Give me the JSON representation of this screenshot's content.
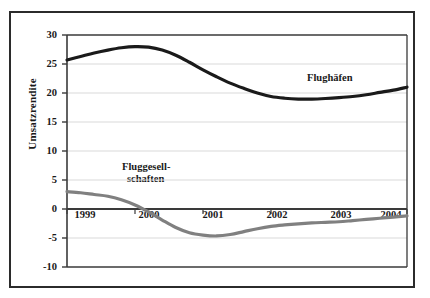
{
  "chart_data": {
    "type": "line",
    "title": "",
    "xlabel": "",
    "ylabel": "Umsatzrendite",
    "ylim": [
      -10,
      30
    ],
    "xlim": [
      1999,
      2004
    ],
    "yticks": [
      "30",
      "25",
      "20",
      "15",
      "10",
      "5",
      "0",
      "-5",
      "-10"
    ],
    "ytick_values": [
      30,
      25,
      20,
      15,
      10,
      5,
      0,
      -5,
      -10
    ],
    "xticks": [
      "1999",
      "2000",
      "2001",
      "2002",
      "2003",
      "2004"
    ],
    "xtick_values": [
      1999,
      2000,
      2001,
      2002,
      2003,
      2004
    ],
    "grid": true,
    "grid_axis": "y",
    "legend_position": "inline-annotations",
    "categories": [
      1999,
      2000,
      2001,
      2002,
      2003,
      2004
    ],
    "series": [
      {
        "name": "Flughäfen",
        "color": "#1a1a1a",
        "values": [
          25.7,
          28.0,
          24.0,
          19.3,
          19.2,
          21.0
        ],
        "dense_x": [
          1999.0,
          1999.2,
          1999.4,
          1999.6,
          1999.8,
          2000.0,
          2000.2,
          2000.4,
          2000.6,
          2000.8,
          2001.0,
          2001.2,
          2001.4,
          2001.6,
          2001.8,
          2002.0,
          2002.2,
          2002.4,
          2002.6,
          2002.8,
          2003.0,
          2003.2,
          2003.4,
          2003.6,
          2003.8,
          2004.0
        ],
        "dense_y": [
          25.7,
          26.3,
          26.9,
          27.4,
          27.8,
          28.0,
          27.9,
          27.4,
          26.5,
          25.3,
          24.0,
          22.8,
          21.7,
          20.8,
          20.0,
          19.4,
          19.1,
          18.95,
          18.95,
          19.05,
          19.2,
          19.4,
          19.7,
          20.1,
          20.5,
          21.0
        ]
      },
      {
        "name": "Fluggesellschaften",
        "color": "#808080",
        "values": [
          3.0,
          0.7,
          -4.4,
          -3.0,
          -2.2,
          -1.2
        ],
        "dense_x": [
          1999.0,
          1999.2,
          1999.4,
          1999.6,
          1999.8,
          2000.0,
          2000.2,
          2000.4,
          2000.6,
          2000.8,
          2001.0,
          2001.2,
          2001.4,
          2001.6,
          2001.8,
          2002.0,
          2002.2,
          2002.4,
          2002.6,
          2002.8,
          2003.0,
          2003.2,
          2003.4,
          2003.6,
          2003.8,
          2004.0
        ],
        "dense_y": [
          3.0,
          2.8,
          2.5,
          2.2,
          1.6,
          0.7,
          -0.5,
          -1.9,
          -3.2,
          -4.1,
          -4.5,
          -4.65,
          -4.4,
          -3.9,
          -3.4,
          -3.0,
          -2.75,
          -2.55,
          -2.4,
          -2.3,
          -2.2,
          -2.0,
          -1.8,
          -1.6,
          -1.4,
          -1.2
        ]
      }
    ],
    "annotations": [
      {
        "id": "label-flughaefen",
        "text": "Flughäfen",
        "x": 2003.0,
        "y": 23.0
      },
      {
        "id": "label-fluggesellschaften-line1",
        "text": "Fluggesell-",
        "x": 2000.0,
        "y": 7.0
      },
      {
        "id": "label-fluggesellschaften-line2",
        "text": "schaften",
        "x": 2000.0,
        "y": 5.0
      }
    ],
    "colors": {
      "series_airports": "#1a1a1a",
      "series_airlines": "#808080",
      "gridline": "#d9d9d9",
      "zero_line": "#3a3a3a",
      "axis": "#3a3a3a",
      "frame": "#2b2b2b",
      "background": "#ffffff",
      "text": "#1a1a1a"
    }
  },
  "axis": {
    "y_title": "Umsatzrendite"
  },
  "labels": {
    "flughaefen": "Flughäfen",
    "fluggesell_line1": "Fluggesell-",
    "fluggesell_line2": "schaften"
  },
  "ytick_labels": {
    "t0": "30",
    "t1": "25",
    "t2": "20",
    "t3": "15",
    "t4": "10",
    "t5": "5",
    "t6": "0",
    "t7": "-5",
    "t8": "-10"
  },
  "xtick_labels": {
    "t0": "1999",
    "t1": "2000",
    "t2": "2001",
    "t3": "2002",
    "t4": "2003",
    "t5": "2004"
  }
}
